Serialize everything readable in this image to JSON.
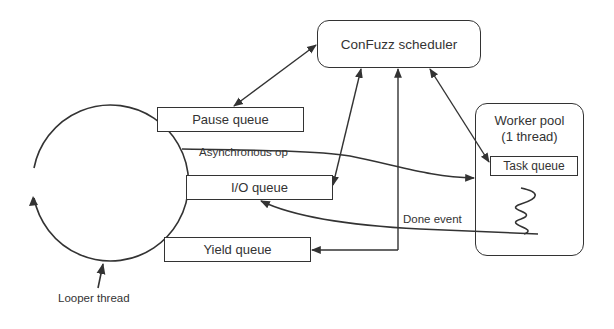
{
  "diagram": {
    "scheduler": {
      "label": "ConFuzz scheduler"
    },
    "queues": {
      "pause": "Pause queue",
      "io": "I/O queue",
      "yield": "Yield queue"
    },
    "worker_pool": {
      "title_line1": "Worker pool",
      "title_line2": "(1 thread)",
      "task_queue": "Task queue"
    },
    "edges": {
      "async_op": "Asynchronous op",
      "done_event": "Done event"
    },
    "looper": {
      "label": "Looper thread"
    },
    "colors": {
      "stroke": "#333333",
      "background": "#ffffff"
    }
  }
}
